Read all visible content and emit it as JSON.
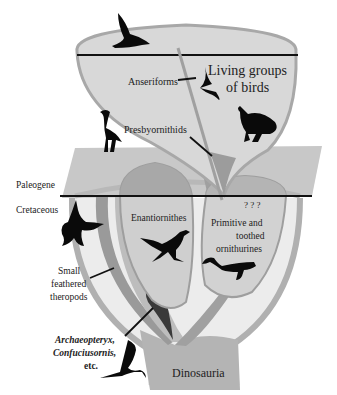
{
  "diagram": {
    "type": "evolutionary-tree-of-birds",
    "colors": {
      "background": "#ffffff",
      "cone_fill": "#d8d8d8",
      "cone_border": "#a8a8a8",
      "plane_fill": "#c8c8c8",
      "lower_basin": "#ececec",
      "branch_mid": "#a0a0a0",
      "branch_dark": "#3a3a3a",
      "boundary_line": "#111111",
      "silhouette": "#0a0a0a"
    },
    "periods": {
      "upper": "Paleogene",
      "lower": "Cretaceous"
    },
    "labels": {
      "living": "Living groups",
      "living2": "of birds",
      "anseriforms": "Anseriforms",
      "presbyornithids": "Presbyornithids",
      "enantiornithes": "Enantiornithes",
      "ornith1": "Primitive and",
      "ornith2": "toothed",
      "ornith3": "ornithurines",
      "theropods1": "Small",
      "theropods2": "feathered",
      "theropods3": "theropods",
      "arch1": "Archaeopteryx,",
      "arch2": "Confuciusornis,",
      "arch3": "etc.",
      "root": "Dinosauria",
      "unknown": "? ? ?"
    },
    "silhouettes": [
      "duck-icon",
      "swift-icon",
      "cassowary-icon",
      "heron-icon",
      "microraptor-icon",
      "enantiornithine-icon",
      "hesperornis-icon",
      "archaeopteryx-icon"
    ]
  }
}
